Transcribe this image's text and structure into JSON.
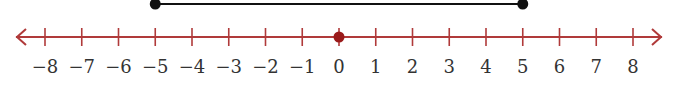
{
  "number_line": {
    "min": -8,
    "max": 8,
    "ticks": [
      -8,
      -7,
      -6,
      -5,
      -4,
      -3,
      -2,
      -1,
      0,
      1,
      2,
      3,
      4,
      5,
      6,
      7,
      8
    ],
    "labels": [
      "−8",
      "−7",
      "−6",
      "−5",
      "−4",
      "−3",
      "−2",
      "−1",
      "0",
      "1",
      "2",
      "3",
      "4",
      "5",
      "6",
      "7",
      "8"
    ],
    "axis_color": "#b03a3a",
    "arrows": "both"
  },
  "marked_point": {
    "value": 0,
    "color": "#9a1a1a"
  },
  "segment": {
    "from": -5,
    "to": 5,
    "color": "#111111",
    "closed_endpoints": true
  }
}
